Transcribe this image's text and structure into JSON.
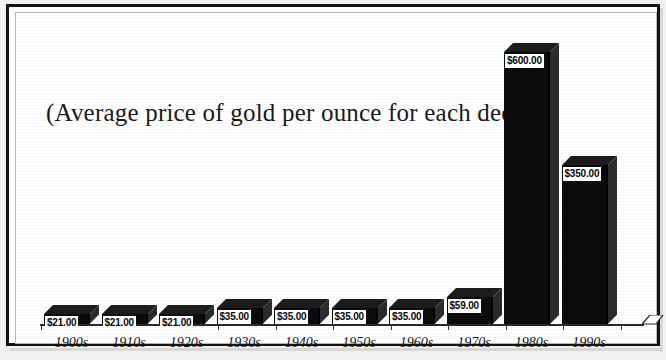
{
  "chart_data": {
    "type": "bar",
    "title": "(Average price of gold per ounce for each decade)",
    "xlabel": "",
    "ylabel": "",
    "ylim": [
      0,
      600
    ],
    "grid": false,
    "legend": "none",
    "categories": [
      "1900s",
      "1910s",
      "1920s",
      "1930s",
      "1940s",
      "1950s",
      "1960s",
      "1970s",
      "1980s",
      "1990s"
    ],
    "values": [
      21,
      35,
      35,
      35,
      35,
      59,
      600,
      350,
      21,
      21
    ],
    "series": [
      {
        "name": "Average price of gold per ounce",
        "points": [
          {
            "category": "1900s",
            "value": 21,
            "label": "$21.00"
          },
          {
            "category": "1910s",
            "value": 21,
            "label": "$21.00"
          },
          {
            "category": "1920s",
            "value": 21,
            "label": "$21.00"
          },
          {
            "category": "1930s",
            "value": 35,
            "label": "$35.00"
          },
          {
            "category": "1940s",
            "value": 35,
            "label": "$35.00"
          },
          {
            "category": "1950s",
            "value": 35,
            "label": "$35.00"
          },
          {
            "category": "1960s",
            "value": 35,
            "label": "$35.00"
          },
          {
            "category": "1970s",
            "value": 59,
            "label": "$59.00"
          },
          {
            "category": "1980s",
            "value": 600,
            "label": "$600.00"
          },
          {
            "category": "1990s",
            "value": 350,
            "label": "$350.00"
          }
        ]
      }
    ],
    "data_labels": [
      "$21.00",
      "$21.00",
      "$21.00",
      "$35.00",
      "$35.00",
      "$35.00",
      "$35.00",
      "$59.00",
      "$600.00",
      "$350.00"
    ],
    "colors": {
      "bar_front": "#0b0b0b",
      "bar_top": "#1c1c1c",
      "bar_side": "#2b2b2b",
      "background": "#ffffff",
      "axis": "#2a2a2a",
      "text": "#151515",
      "label_background": "#ffffff"
    }
  }
}
